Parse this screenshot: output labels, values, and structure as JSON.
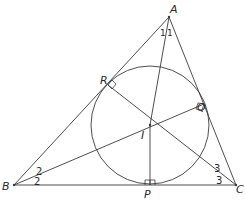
{
  "diagram": {
    "points": {
      "A": {
        "label": "A",
        "x": 169,
        "y": 17
      },
      "B": {
        "label": "B",
        "x": 14,
        "y": 185
      },
      "C": {
        "label": "C",
        "x": 236,
        "y": 185
      },
      "I": {
        "label": "I",
        "x": 150,
        "y": 125
      },
      "P": {
        "label": "P",
        "x": 150,
        "y": 185
      },
      "Q": {
        "label": "Q",
        "x": 204,
        "y": 104
      },
      "R": {
        "label": "R",
        "x": 108,
        "y": 85
      }
    },
    "incircle": {
      "center": "I",
      "radius": 59
    },
    "angle_marks": {
      "A_left": "1",
      "A_right": "1",
      "B_upper": "2",
      "B_lower": "2",
      "C_upper": "3",
      "C_lower": "3"
    },
    "right_angles": [
      "R",
      "Q",
      "P"
    ],
    "colors": {
      "stroke": "#3a3a3a",
      "background": "#ffffff"
    }
  }
}
